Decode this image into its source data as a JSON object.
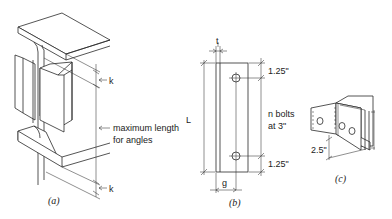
{
  "figure": {
    "panel_a": {
      "caption": "(a)",
      "dim_k_top": "k",
      "dim_k_bottom": "k",
      "max_length_line1": "maximum length",
      "max_length_line2": "for angles"
    },
    "panel_b": {
      "caption": "(b)",
      "dim_t": "t",
      "dim_L": "L",
      "dim_g": "g",
      "edge_top": "1.25\"",
      "edge_bottom": "1.25\"",
      "bolts_line1": "n bolts",
      "bolts_line2": "at 3\""
    },
    "panel_c": {
      "caption": "(c)",
      "dim_gage": "2.5\""
    }
  }
}
